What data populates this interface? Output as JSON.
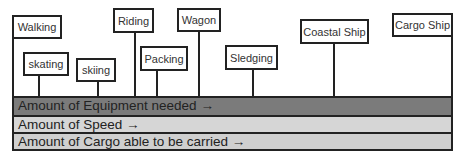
{
  "modes": [
    {
      "label": "Walking",
      "box": {
        "x": 12,
        "y": 15,
        "w": 50,
        "h": 24
      },
      "line_x": 12
    },
    {
      "label": "skating",
      "box": {
        "x": 23,
        "y": 52,
        "w": 46,
        "h": 24
      },
      "line_x": 38
    },
    {
      "label": "skiing",
      "box": {
        "x": 76,
        "y": 58,
        "w": 40,
        "h": 24
      },
      "line_x": 97
    },
    {
      "label": "Riding",
      "box": {
        "x": 113,
        "y": 8,
        "w": 41,
        "h": 25
      },
      "line_x": 134
    },
    {
      "label": "Packing",
      "box": {
        "x": 140,
        "y": 46,
        "w": 48,
        "h": 25
      },
      "line_x": 156
    },
    {
      "label": "Wagon",
      "box": {
        "x": 177,
        "y": 8,
        "w": 44,
        "h": 24
      },
      "line_x": 198
    },
    {
      "label": "Sledging",
      "box": {
        "x": 225,
        "y": 45,
        "w": 53,
        "h": 25
      },
      "line_x": 252
    },
    {
      "label": "Coastal Ship",
      "box": {
        "x": 300,
        "y": 19,
        "w": 69,
        "h": 25
      },
      "line_x": 333
    },
    {
      "label": "Cargo Ship",
      "box": {
        "x": 392,
        "y": 13,
        "w": 61,
        "h": 24
      },
      "line_x": 451
    }
  ],
  "scales": [
    {
      "label": "Amount of Equipment needed →",
      "color": "#7b7b7b"
    },
    {
      "label": "Amount of Speed →",
      "color": "#d6d6d6"
    },
    {
      "label": "Amount of Cargo able to be carried →",
      "color": "#cfcfcf"
    }
  ]
}
